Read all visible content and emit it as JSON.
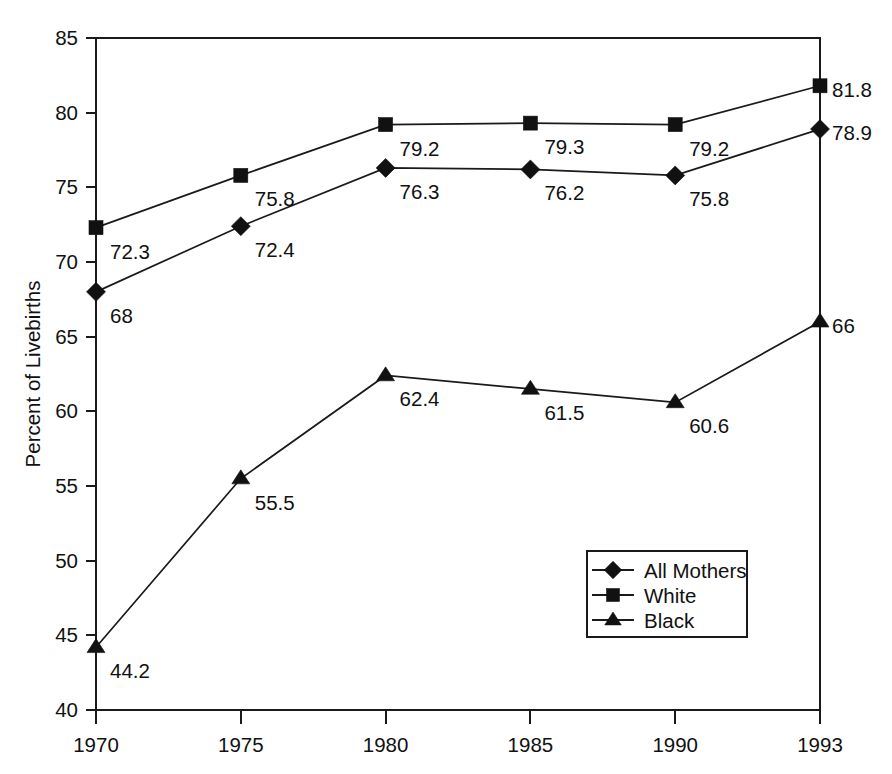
{
  "chart_data": {
    "type": "line",
    "title": "",
    "xlabel": "",
    "ylabel": "Percent of Livebirths",
    "categories": [
      "1970",
      "1975",
      "1980",
      "1985",
      "1990",
      "1993"
    ],
    "ylim": [
      40,
      85
    ],
    "y_ticks": [
      "40",
      "45",
      "50",
      "55",
      "60",
      "65",
      "70",
      "75",
      "80",
      "85"
    ],
    "grid": false,
    "legend_position": "inside-lower-right",
    "series": [
      {
        "name": "All Mothers",
        "marker": "diamond",
        "values": [
          68,
          72.4,
          76.3,
          76.2,
          75.8,
          78.9
        ],
        "labels": [
          "68",
          "72.4",
          "76.3",
          "76.2",
          "75.8",
          "78.9"
        ]
      },
      {
        "name": "White",
        "marker": "square",
        "values": [
          72.3,
          75.8,
          79.2,
          79.3,
          79.2,
          81.8
        ],
        "labels": [
          "72.3",
          "75.8",
          "79.2",
          "79.3",
          "79.2",
          "81.8"
        ]
      },
      {
        "name": "Black",
        "marker": "triangle",
        "values": [
          44.2,
          55.5,
          62.4,
          61.5,
          60.6,
          66
        ],
        "labels": [
          "44.2",
          "55.5",
          "62.4",
          "61.5",
          "60.6",
          "66"
        ]
      }
    ]
  },
  "axes": {
    "y_axis_title": "Percent of Livebirths",
    "y_tick_labels": [
      "85",
      "80",
      "75",
      "70",
      "65",
      "60",
      "55",
      "50",
      "45",
      "40"
    ],
    "x_tick_labels": [
      "1970",
      "1975",
      "1980",
      "1985",
      "1990",
      "1993"
    ]
  },
  "legend": {
    "entries": [
      {
        "label": "All Mothers",
        "marker": "diamond-marker-icon"
      },
      {
        "label": "White",
        "marker": "square-marker-icon"
      },
      {
        "label": "Black",
        "marker": "triangle-marker-icon"
      }
    ]
  },
  "colors": {
    "ink": "#111111",
    "axis": "#1a1a1a",
    "background": "#ffffff"
  }
}
